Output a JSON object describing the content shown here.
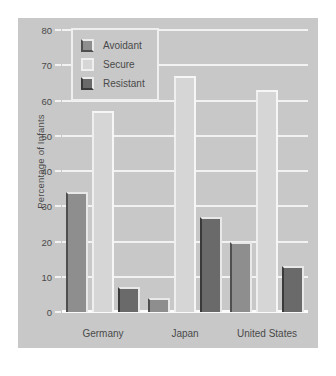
{
  "chart_data": {
    "type": "bar",
    "title": "",
    "xlabel": "",
    "ylabel": "Percentage of Infants",
    "ylim": [
      0,
      80
    ],
    "yticks": [
      0,
      10,
      20,
      30,
      40,
      50,
      60,
      70,
      80
    ],
    "grid": true,
    "legend_position": "upper left (inside plot)",
    "categories": [
      "Germany",
      "Japan",
      "United States"
    ],
    "series": [
      {
        "name": "Avoidant",
        "values": [
          34,
          4,
          20
        ],
        "color": "#8e8e8e"
      },
      {
        "name": "Secure",
        "values": [
          57,
          67,
          63
        ],
        "color": "#d6d6d6"
      },
      {
        "name": "Resistant",
        "values": [
          7,
          27,
          13
        ],
        "color": "#6a6a6a"
      }
    ]
  },
  "legend": {
    "items": [
      {
        "label": "Avoidant",
        "swatch": "legend-swatch-avoidant"
      },
      {
        "label": "Secure",
        "swatch": "legend-swatch-secure"
      },
      {
        "label": "Resistant",
        "swatch": "legend-swatch-resistant"
      }
    ]
  },
  "colors": {
    "panel": "#c8c8c8",
    "gridline": "#f2f2f2",
    "text": "#4a4a4a",
    "avoidant": "#8e8e8e",
    "secure": "#d6d6d6",
    "resistant": "#6a6a6a"
  }
}
